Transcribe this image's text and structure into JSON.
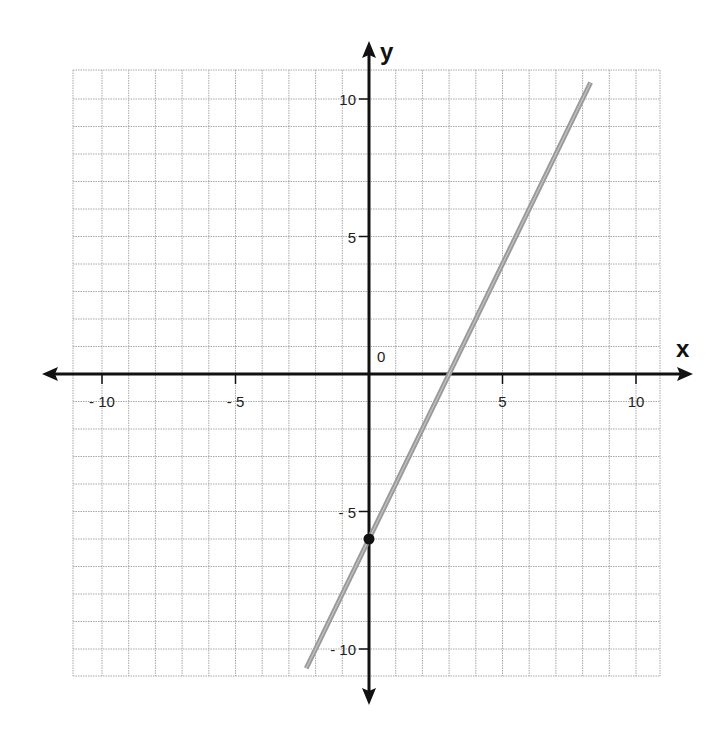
{
  "chart_data": {
    "type": "line",
    "title": "",
    "xlabel": "x",
    "ylabel": "y",
    "xlim": [
      -11,
      11
    ],
    "ylim": [
      -11,
      11
    ],
    "grid": true,
    "origin_label": "0",
    "x_ticks": [
      {
        "value": -10,
        "label": "-10"
      },
      {
        "value": -5,
        "label": "-5"
      },
      {
        "value": 5,
        "label": "5"
      },
      {
        "value": 10,
        "label": "10"
      }
    ],
    "y_ticks": [
      {
        "value": 10,
        "label": "10"
      },
      {
        "value": 5,
        "label": "5"
      },
      {
        "value": -5,
        "label": "-5"
      },
      {
        "value": -10,
        "label": "-10"
      }
    ],
    "series": [
      {
        "name": "y = 2x - 6",
        "slope": 2,
        "intercept": -6,
        "x": [
          -2.35,
          8.3
        ],
        "y": [
          -10.7,
          10.6
        ],
        "color": "#9a9a9a"
      }
    ],
    "points": [
      {
        "x": 0,
        "y": -6,
        "label": "y-intercept",
        "color": "#111111"
      }
    ],
    "x_intercept": 3,
    "colors": {
      "grid": "#a8a8a8",
      "axis": "#111111",
      "line": "#9a9a9a"
    }
  }
}
